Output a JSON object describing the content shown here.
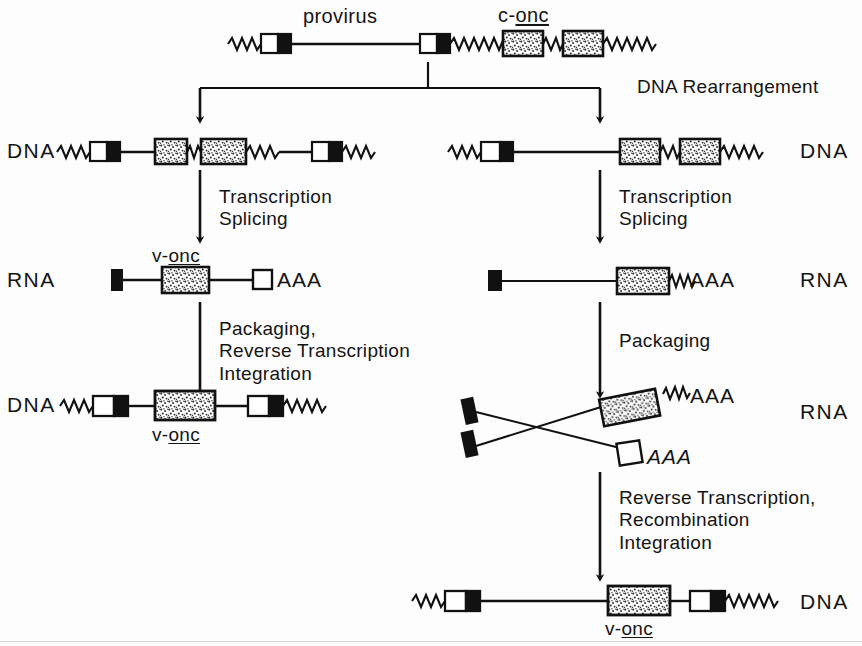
{
  "figure": {
    "title_top_left": "provirus",
    "title_top_right_prefix": "c-",
    "title_top_right_gene": "onc",
    "step_dna_rearrangement": "DNA Rearrangement",
    "row_labels": {
      "dna_left_1": "DNA",
      "dna_right_1": "DNA",
      "rna_left": "RNA",
      "rna_right_1": "RNA",
      "dna_left_2": "DNA",
      "rna_right_2": "RNA",
      "dna_bottom": "DNA"
    },
    "steps": {
      "left_transcription": "Transcription\nSplicing",
      "left_packaging": "Packaging,\nReverse Transcription\nIntegration",
      "right_transcription": "Transcription\nSplicing",
      "right_packaging": "Packaging",
      "right_reverse": "Reverse Transcription,\nRecombination\nIntegration"
    },
    "gene_labels": {
      "v_onc_prefix": "v-",
      "v_onc_gene": "onc",
      "rna_left_label_prefix": "v-",
      "rna_left_label_gene": "onc",
      "dna_left2_label_prefix": "v-",
      "dna_left2_label_gene": "onc",
      "dna_bottom_label_prefix": "v-",
      "dna_bottom_label_gene": "onc"
    },
    "poly_a": {
      "rna_left": "AAA",
      "rna_right_1": "AAA",
      "rna_right_2_upper": "AAA",
      "rna_right_2_lower": "AAA"
    },
    "colors": {
      "ink": "#111111",
      "paper": "#fdfdfd",
      "exon_fill": "#d9d9d9",
      "ltr_black": "#000000",
      "ltr_white": "#ffffff"
    },
    "legend_shapes": {
      "ltr": "ltr-box-white-black",
      "exon": "stippled-exon-box",
      "flank": "zigzag-flanking-dna",
      "arrow": "process-arrow"
    }
  }
}
